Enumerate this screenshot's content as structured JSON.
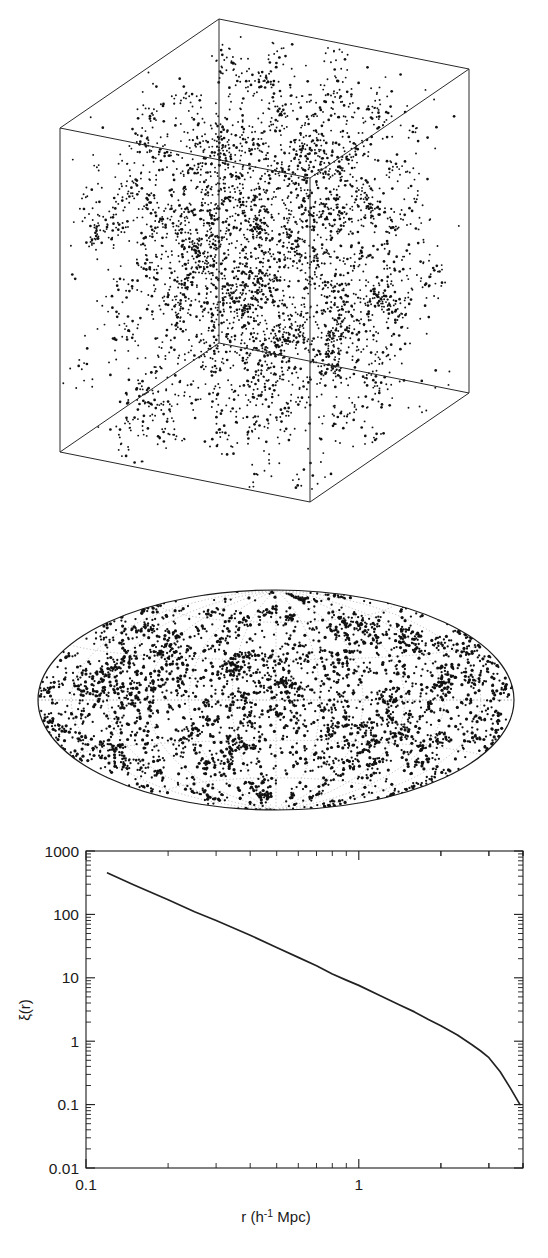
{
  "figure": {
    "panels": [
      "simulation-cube",
      "all-sky-projection",
      "correlation-function"
    ],
    "background_color": "#ffffff",
    "ink_color": "#1a1a1a"
  },
  "cube_panel": {
    "name": "simulation-cube",
    "description": "3D box of point-like galaxies showing filamentary clustering",
    "point_count": 4200,
    "vertices": {
      "top_back": [
        219,
        19
      ],
      "top_left": [
        60,
        128
      ],
      "top_right": [
        485,
        60
      ],
      "top_front": [
        310,
        178
      ],
      "bottom_left": [
        60,
        452
      ],
      "bottom_right": [
        485,
        382
      ],
      "bottom_front": [
        219,
        530
      ],
      "bottom_back": [
        310,
        96
      ]
    }
  },
  "sky_panel": {
    "name": "all-sky-projection",
    "projection": "aitoff",
    "description": "All-sky equal-area projection of galaxy positions with dotted graticule",
    "point_count": 3400,
    "center": [
      276,
      700
    ],
    "semi_axis_x": 238,
    "semi_axis_y": 110,
    "graticule": {
      "meridian_step_deg": 30,
      "parallel_step_deg": 30,
      "visible": true
    }
  },
  "chart_data": {
    "type": "line",
    "title": "",
    "xlabel": "r (h⁻¹ Mpc)",
    "ylabel": "ξ(r)",
    "xscale": "log",
    "yscale": "log",
    "xlim": [
      0.1,
      4.0
    ],
    "ylim": [
      0.01,
      1000
    ],
    "xticklabels": [
      "0.1",
      "1"
    ],
    "xtickvalues": [
      0.1,
      1
    ],
    "yticklabels": [
      "1000",
      "100",
      "10",
      "1",
      "0.1",
      "0.01"
    ],
    "ytickvalues": [
      1000,
      100,
      10,
      1,
      0.1,
      0.01
    ],
    "grid": false,
    "legend": null,
    "series": [
      {
        "name": "two-point correlation function",
        "x": [
          0.12,
          0.15,
          0.2,
          0.25,
          0.3,
          0.4,
          0.5,
          0.6,
          0.7,
          0.8,
          0.9,
          1.0,
          1.2,
          1.4,
          1.6,
          1.8,
          2.0,
          2.3,
          2.6,
          2.8,
          3.0,
          3.3,
          3.6,
          3.9
        ],
        "y": [
          450,
          290,
          170,
          110,
          80,
          47,
          30,
          21,
          15.5,
          11.5,
          9.2,
          7.6,
          5.2,
          3.8,
          2.9,
          2.2,
          1.75,
          1.25,
          0.88,
          0.7,
          0.55,
          0.33,
          0.18,
          0.1
        ]
      }
    ]
  },
  "axis_labels": {
    "x": "r (h",
    "x_exponent": "-1",
    "x_tail": " Mpc)",
    "y": "ξ(r)"
  }
}
